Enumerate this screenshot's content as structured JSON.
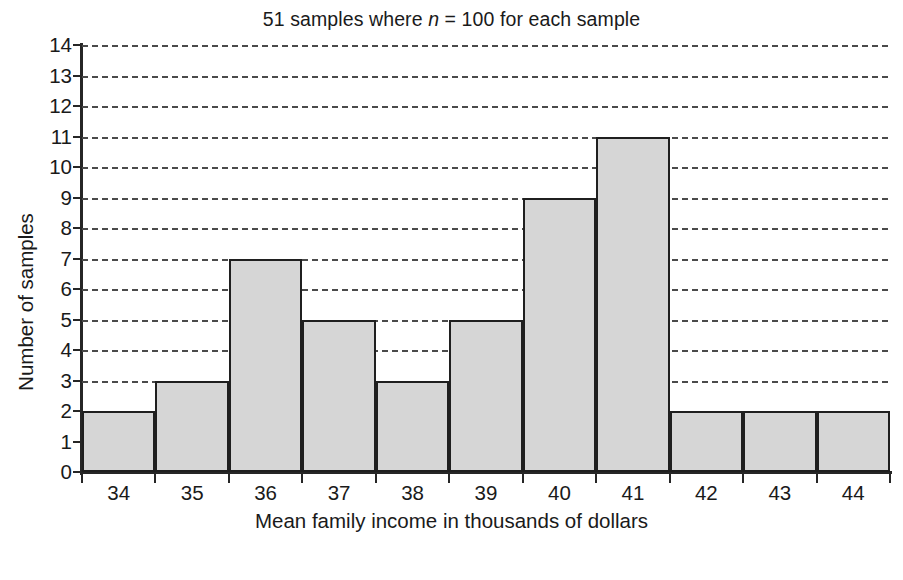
{
  "chart_data": {
    "type": "bar",
    "title": "51 samples where n = 100 for each sample",
    "title_prefix": "51 samples where ",
    "title_italic": "n",
    "title_suffix": " = 100 for each sample",
    "xlabel": "Mean family income in thousands of dollars",
    "ylabel": "Number of samples",
    "categories": [
      "34",
      "35",
      "36",
      "37",
      "38",
      "39",
      "40",
      "41",
      "42",
      "43",
      "44"
    ],
    "values": [
      2,
      3,
      7,
      5,
      3,
      5,
      9,
      11,
      2,
      2,
      2
    ],
    "xtick_labels": [
      "34",
      "35",
      "36",
      "37",
      "38",
      "39",
      "40",
      "41",
      "42",
      "43",
      "44"
    ],
    "ytick_labels": [
      "0",
      "1",
      "2",
      "3",
      "4",
      "5",
      "6",
      "7",
      "8",
      "9",
      "10",
      "11",
      "12",
      "13",
      "14"
    ],
    "ylim": [
      0,
      14
    ],
    "ytick_step": 1,
    "grid": true,
    "grid_axis": "y",
    "grid_style": "dashed",
    "legend": null,
    "bar_fill_color": "#d6d6d6",
    "bar_edge_color": "#1f1f1f",
    "axis_color": "#262626",
    "background_color": "#ffffff",
    "n_per_sample": 100,
    "n_samples": 51,
    "bins_contiguous": true
  }
}
